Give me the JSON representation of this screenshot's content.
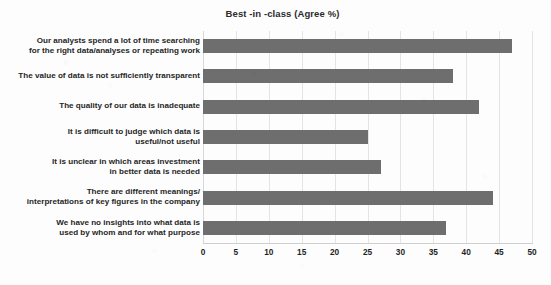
{
  "chart_data": {
    "type": "bar",
    "orientation": "horizontal",
    "title": "Best -in -class (Agree %)",
    "xlabel": "",
    "ylabel": "",
    "xlim": [
      0,
      50
    ],
    "xticks": [
      0,
      5,
      10,
      15,
      20,
      25,
      30,
      35,
      40,
      45,
      50
    ],
    "grid": "vertical",
    "legend": "none",
    "bar_color": "#6e6e6e",
    "background_color": "#fdfdfd",
    "gridline_color": "#e4e4e4",
    "categories": [
      "Our analysts spend a lot of time searching for the right data/analyses or repeating work",
      "The value of data is not sufficiently transparent",
      "The quality of our data is inadequate",
      "It is difficult to judge which data is useful/not useful",
      "It is unclear in which areas investment in better data is needed",
      "There are different meanings/ interpretations of key figures in the company",
      "We have no insights into what data is used by whom and for what purpose"
    ],
    "category_lines": [
      [
        "Our analysts spend a lot of time searching",
        "for the right data/analyses or repeating work"
      ],
      [
        "The value of data is not sufficiently transparent"
      ],
      [
        "The quality of our data is inadequate"
      ],
      [
        "It is difficult to judge which data is",
        "useful/not useful"
      ],
      [
        "It is unclear in which areas investment",
        "in better data is needed"
      ],
      [
        "There are different meanings/",
        "interpretations of key figures in the company"
      ],
      [
        "We have no insights into what data is",
        "used by whom and for what purpose"
      ]
    ],
    "values": [
      47,
      38,
      42,
      25,
      27,
      44,
      37
    ]
  }
}
